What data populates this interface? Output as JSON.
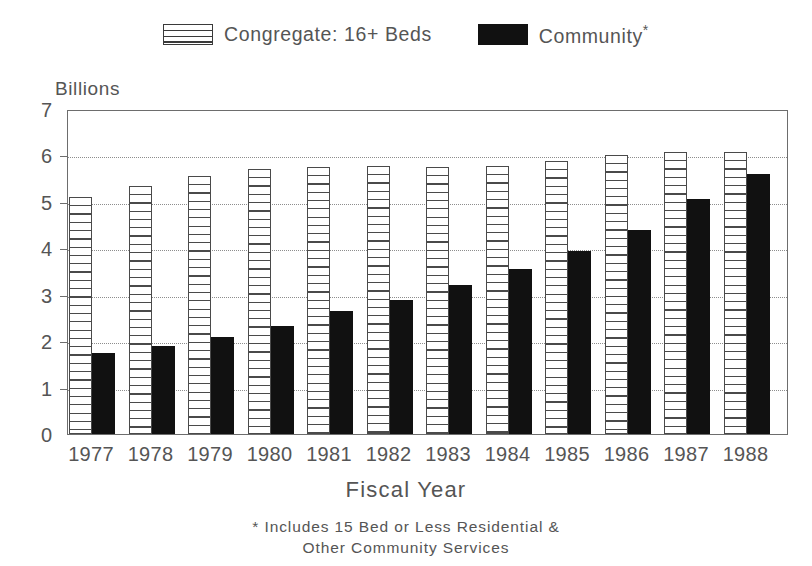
{
  "legend": {
    "items": [
      {
        "label": "Congregate: 16+ Beds",
        "swatch": "hatched-rect-icon",
        "color": "#ffffff"
      },
      {
        "label": "Community",
        "suffix": "*",
        "swatch": "solid-black-rect-icon",
        "color": "#111111"
      }
    ]
  },
  "axis": {
    "y_title": "Billions",
    "x_title": "Fiscal Year",
    "y_ticks": [
      "0",
      "1",
      "2",
      "3",
      "4",
      "5",
      "6",
      "7"
    ]
  },
  "footnote": {
    "line1": "* Includes 15 Bed or Less Residential &",
    "line2": "Other Community Services"
  },
  "chart_data": {
    "type": "bar",
    "title": "",
    "subtitle": "",
    "xlabel": "Fiscal Year",
    "ylabel": "Billions",
    "ylim": [
      0,
      7
    ],
    "ytick_values": [
      0,
      1,
      2,
      3,
      4,
      5,
      6,
      7
    ],
    "grid": "horizontal-dotted",
    "legend_position": "top-center",
    "categories": [
      "1977",
      "1978",
      "1979",
      "1980",
      "1981",
      "1982",
      "1983",
      "1984",
      "1985",
      "1986",
      "1987",
      "1988"
    ],
    "series": [
      {
        "name": "Congregate: 16+ Beds",
        "color": "#ffffff",
        "pattern": "horizontal-hatch",
        "values": [
          5.1,
          5.35,
          5.55,
          5.7,
          5.75,
          5.78,
          5.75,
          5.77,
          5.87,
          6.0,
          6.07,
          6.07
        ]
      },
      {
        "name": "Community",
        "color": "#111111",
        "pattern": "solid",
        "values": [
          1.75,
          1.9,
          2.1,
          2.32,
          2.65,
          2.88,
          3.2,
          3.55,
          3.95,
          4.4,
          5.07,
          5.6
        ]
      }
    ],
    "annotations": [
      "* Includes 15 Bed or Less Residential & Other Community Services"
    ]
  }
}
